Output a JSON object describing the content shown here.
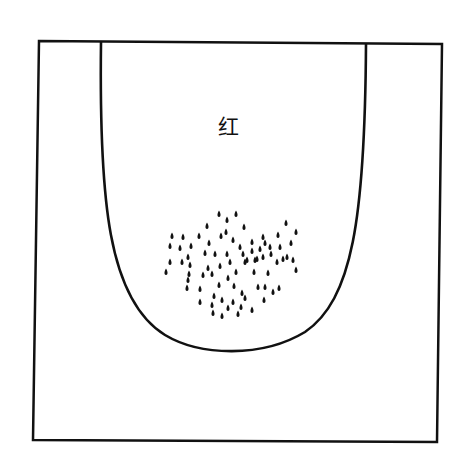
{
  "figure": {
    "label": "红",
    "label_position": {
      "x": 218,
      "y": 110
    },
    "outer_frame": {
      "points": [
        [
          39,
          41
        ],
        [
          442,
          44
        ],
        [
          437,
          442
        ],
        [
          33,
          440
        ]
      ]
    },
    "u_shape": {
      "left_x": 101,
      "right_x": 366,
      "top_y": 42,
      "bottom_y": 352
    },
    "ink_color": "#111111",
    "background": "#ffffff",
    "dots": [
      [
        219,
        214
      ],
      [
        227,
        220
      ],
      [
        236,
        214
      ],
      [
        207,
        226
      ],
      [
        226,
        232
      ],
      [
        244,
        227
      ],
      [
        286,
        223
      ],
      [
        263,
        237
      ],
      [
        278,
        235
      ],
      [
        296,
        232
      ],
      [
        172,
        236
      ],
      [
        183,
        237
      ],
      [
        199,
        236
      ],
      [
        221,
        236
      ],
      [
        170,
        246
      ],
      [
        191,
        246
      ],
      [
        209,
        243
      ],
      [
        233,
        240
      ],
      [
        252,
        242
      ],
      [
        265,
        243
      ],
      [
        180,
        248
      ],
      [
        240,
        247
      ],
      [
        243,
        254
      ],
      [
        252,
        251
      ],
      [
        260,
        249
      ],
      [
        270,
        247
      ],
      [
        280,
        247
      ],
      [
        291,
        243
      ],
      [
        188,
        257
      ],
      [
        205,
        253
      ],
      [
        215,
        254
      ],
      [
        227,
        254
      ],
      [
        247,
        260
      ],
      [
        257,
        259
      ],
      [
        271,
        254
      ],
      [
        287,
        257
      ],
      [
        293,
        260
      ],
      [
        170,
        262
      ],
      [
        182,
        262
      ],
      [
        190,
        265
      ],
      [
        208,
        268
      ],
      [
        220,
        266
      ],
      [
        230,
        262
      ],
      [
        245,
        262
      ],
      [
        255,
        260
      ],
      [
        263,
        257
      ],
      [
        277,
        262
      ],
      [
        283,
        259
      ],
      [
        189,
        274
      ],
      [
        203,
        275
      ],
      [
        212,
        274
      ],
      [
        228,
        278
      ],
      [
        236,
        272
      ],
      [
        254,
        272
      ],
      [
        268,
        273
      ],
      [
        296,
        270
      ],
      [
        166,
        272
      ],
      [
        188,
        280
      ],
      [
        219,
        285
      ],
      [
        234,
        286
      ],
      [
        258,
        287
      ],
      [
        273,
        292
      ],
      [
        187,
        288
      ],
      [
        200,
        289
      ],
      [
        214,
        296
      ],
      [
        242,
        293
      ],
      [
        265,
        287
      ],
      [
        279,
        288
      ],
      [
        222,
        300
      ],
      [
        233,
        302
      ],
      [
        245,
        298
      ],
      [
        212,
        305
      ],
      [
        228,
        308
      ],
      [
        241,
        307
      ],
      [
        213,
        313
      ],
      [
        222,
        316
      ],
      [
        238,
        314
      ],
      [
        252,
        310
      ],
      [
        200,
        302
      ],
      [
        264,
        300
      ]
    ]
  }
}
